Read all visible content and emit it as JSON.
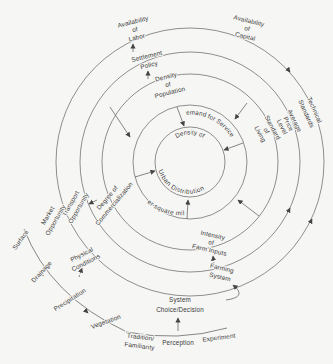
{
  "figure": {
    "background": "#f6f6f4",
    "line_color": "#6b6b6b",
    "text_color": "#3a3a3a",
    "hub": {
      "top": "Density of",
      "bottom": "Urban Distribution"
    },
    "ring1": {
      "top": "Demand for Services",
      "bottom": "per square mile"
    },
    "labels": {
      "availability_labor": [
        "Availability",
        "of",
        "Labor"
      ],
      "settlement_policy": [
        "Settlement",
        "Policy"
      ],
      "density_population": [
        "Density",
        "of",
        "Population"
      ],
      "availability_capital": [
        "Availability",
        "of",
        "Capital"
      ],
      "technical_standards": [
        "Technical",
        "Standards"
      ],
      "average_price_level": [
        "Average",
        "Price",
        "Level"
      ],
      "standard_of_living": [
        "Standard",
        "of",
        "Living"
      ],
      "intensity_farm_inputs": [
        "Intensity",
        "of",
        "Farm Inputs"
      ],
      "farming_system": [
        "Farming",
        "System"
      ],
      "system_choice": [
        "System",
        "Choice/Decision"
      ],
      "tradition_familiarity": [
        "Tradition/",
        "Familiarity"
      ],
      "perception": [
        "Perception"
      ],
      "experiment": [
        "Experiment"
      ],
      "vegetation": [
        "Vegetation"
      ],
      "precipitation": [
        "Precipitation"
      ],
      "drainage": [
        "Drainage"
      ],
      "surface": [
        "Surface"
      ],
      "physical_conditions": [
        "Physical",
        "Conditions"
      ],
      "degree_commercialization": [
        "Degree of",
        "Commercialization"
      ],
      "transport_opportunity": [
        "Transport",
        "Opportunity"
      ],
      "market_opportunity": [
        "Market",
        "Opportunity"
      ]
    }
  }
}
